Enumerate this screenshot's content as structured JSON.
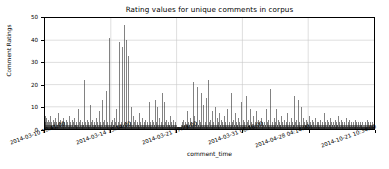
{
  "chart_data": {
    "type": "line",
    "render": "impulse",
    "title": "Rating values for unique comments in corpus",
    "xlabel": "comment_time",
    "ylabel": "Comment Ratings",
    "grid": true,
    "legend": "none",
    "series_color": "#1a1a1a",
    "background": "#ffffff",
    "grid_color": "#c8c8c8",
    "ylim": [
      0,
      50
    ],
    "yticks": [
      0,
      10,
      20,
      30,
      40,
      50
    ],
    "ytick_labels": [
      "0",
      "10",
      "20",
      "30",
      "40",
      "50"
    ],
    "xtick_labels": [
      "2014-03-10 18:41:00",
      "2014-03-14 15:14:00",
      "2014-03-21 17:29:00",
      "2014-03-31 06:16:00",
      "2014-04-28 04:14:00",
      "2014-10-21 10:34:00"
    ],
    "xtick_positions": [
      0.0,
      0.2,
      0.4,
      0.6,
      0.8,
      1.0
    ],
    "x": "index of unique comments ordered by comment_time",
    "values": [
      6,
      2,
      3,
      1,
      5,
      2,
      1,
      3,
      2,
      1,
      2,
      4,
      1,
      2,
      1,
      3,
      1,
      2,
      6,
      1,
      2,
      1,
      3,
      1,
      2,
      1,
      4,
      2,
      1,
      3,
      1,
      2,
      1,
      5,
      1,
      2,
      1,
      3,
      2,
      1,
      2,
      1,
      7,
      2,
      1,
      3,
      1,
      2,
      1,
      4,
      2,
      1,
      2,
      1,
      3,
      1,
      2,
      1,
      2,
      5,
      1,
      2,
      1,
      3,
      1,
      2,
      1,
      4,
      1,
      2,
      1,
      3,
      2,
      1,
      2,
      1,
      6,
      1,
      2,
      1,
      3,
      1,
      2,
      1,
      2,
      1,
      4,
      1,
      2,
      1,
      3,
      1,
      2,
      1,
      5,
      2,
      1,
      2,
      1,
      3,
      1,
      2,
      1,
      2,
      1,
      9,
      1,
      2,
      1,
      3,
      1,
      2,
      1,
      4,
      1,
      2,
      1,
      2,
      1,
      3,
      1,
      2,
      1,
      2,
      1,
      22,
      1,
      2,
      1,
      3,
      1,
      2,
      1,
      4,
      1,
      2,
      1,
      3,
      1,
      2,
      1,
      2,
      1,
      11,
      1,
      2,
      1,
      3,
      1,
      2,
      1,
      4,
      1,
      2,
      1,
      2,
      1,
      3,
      1,
      2,
      1,
      2,
      1,
      5,
      1,
      2,
      1,
      3,
      1,
      2,
      1,
      8,
      1,
      2,
      1,
      3,
      1,
      2,
      1,
      2,
      1,
      13,
      1,
      2,
      1,
      3,
      1,
      2,
      1,
      4,
      1,
      2,
      1,
      2,
      1,
      17,
      1,
      2,
      1,
      3,
      1,
      2,
      1,
      2,
      1,
      41,
      1,
      2,
      1,
      3,
      1,
      2,
      1,
      4,
      1,
      2,
      1,
      2,
      1,
      5,
      1,
      2,
      1,
      3,
      1,
      2,
      1,
      9,
      1,
      2,
      1,
      3,
      1,
      2,
      1,
      2,
      1,
      39,
      1,
      2,
      1,
      3,
      1,
      2,
      1,
      37,
      1,
      2,
      1,
      2,
      1,
      47,
      1,
      2,
      1,
      3,
      1,
      2,
      1,
      40,
      1,
      2,
      1,
      2,
      1,
      33,
      1,
      2,
      1,
      3,
      1,
      2,
      1,
      10,
      1,
      2,
      1,
      2,
      1,
      6,
      1,
      2,
      1,
      3,
      1,
      2,
      1,
      4,
      1,
      2,
      1,
      2,
      1,
      3,
      1,
      2,
      1,
      2,
      1,
      7,
      1,
      2,
      1,
      3,
      1,
      2,
      1,
      2,
      1,
      5,
      1,
      2,
      1,
      3,
      1,
      2,
      1,
      2,
      1,
      4,
      1,
      2,
      1,
      3,
      1,
      2,
      1,
      2,
      1,
      12,
      1,
      2,
      1,
      3,
      1,
      2,
      1,
      2,
      1,
      4,
      1,
      2,
      1,
      3,
      1,
      2,
      1,
      2,
      1,
      13,
      1,
      2,
      1,
      3,
      1,
      2,
      1,
      10,
      1,
      2,
      1,
      2,
      1,
      5,
      1,
      2,
      1,
      3,
      1,
      2,
      1,
      16,
      1,
      2,
      1,
      2,
      1,
      12,
      1,
      2,
      1,
      3,
      1,
      2,
      1,
      4,
      1,
      2,
      1,
      2,
      1,
      3,
      1,
      2,
      1,
      2,
      1,
      6,
      1,
      2,
      1,
      3,
      1,
      2,
      1,
      2,
      1,
      4,
      1,
      2,
      1,
      3,
      1,
      2,
      1,
      2,
      1,
      1,
      1,
      1,
      1,
      1,
      1,
      1,
      1,
      1,
      1,
      1,
      1,
      1,
      1,
      1,
      2,
      1,
      3,
      1,
      2,
      1,
      4,
      1,
      2,
      1,
      2,
      1,
      3,
      1,
      2,
      1,
      2,
      1,
      8,
      1,
      2,
      1,
      3,
      1,
      2,
      1,
      2,
      1,
      5,
      1,
      2,
      1,
      3,
      1,
      2,
      1,
      21,
      1,
      2,
      1,
      2,
      1,
      6,
      1,
      2,
      1,
      3,
      1,
      2,
      1,
      19,
      1,
      2,
      1,
      2,
      1,
      4,
      1,
      2,
      1,
      3,
      1,
      2,
      1,
      16,
      1,
      2,
      1,
      2,
      1,
      11,
      1,
      2,
      1,
      3,
      1,
      2,
      1,
      14,
      1,
      2,
      1,
      2,
      1,
      22,
      1,
      2,
      1,
      3,
      1,
      2,
      1,
      4,
      1,
      2,
      1,
      2,
      1,
      8,
      1,
      2,
      1,
      3,
      1,
      2,
      1,
      10,
      1,
      2,
      1,
      2,
      1,
      5,
      1,
      2,
      1,
      3,
      1,
      2,
      1,
      7,
      1,
      2,
      1,
      2,
      1,
      4,
      1,
      2,
      1,
      3,
      1,
      2,
      1,
      2,
      1,
      6,
      1,
      2,
      1,
      3,
      1,
      2,
      1,
      9,
      1,
      2,
      1,
      2,
      1,
      3,
      1,
      2,
      1,
      2,
      1,
      16,
      1,
      2,
      1,
      3,
      1,
      2,
      1,
      4,
      1,
      2,
      1,
      2,
      1,
      7,
      1,
      2,
      1,
      3,
      1,
      2,
      1,
      2,
      1,
      5,
      1,
      2,
      1,
      3,
      1,
      2,
      1,
      12,
      1,
      2,
      1,
      2,
      1,
      4,
      1,
      2,
      1,
      3,
      1,
      2,
      1,
      2,
      1,
      15,
      1,
      2,
      1,
      3,
      1,
      2,
      1,
      4,
      1,
      2,
      1,
      2,
      1,
      9,
      1,
      2,
      1,
      3,
      1,
      2,
      1,
      2,
      1,
      6,
      1,
      2,
      1,
      3,
      1,
      2,
      1,
      8,
      1,
      2,
      1,
      2,
      1,
      4,
      1,
      2,
      1,
      3,
      1,
      2,
      1,
      2,
      1,
      5,
      1,
      2,
      1,
      3,
      1,
      2,
      1,
      2,
      1,
      3,
      1,
      2,
      1,
      2,
      1,
      9,
      1,
      2,
      1,
      3,
      1,
      2,
      1,
      4,
      1,
      2,
      1,
      2,
      1,
      18,
      1,
      2,
      1,
      3,
      1,
      2,
      1,
      2,
      1,
      5,
      1,
      2,
      1,
      3,
      1,
      2,
      1,
      9,
      1,
      2,
      1,
      2,
      1,
      4,
      1,
      2,
      1,
      3,
      1,
      2,
      1,
      2,
      1,
      6,
      1,
      2,
      1,
      3,
      1,
      2,
      1,
      2,
      1,
      4,
      1,
      2,
      1,
      3,
      1,
      2,
      1,
      7,
      1,
      2,
      1,
      2,
      1,
      3,
      1,
      2,
      1,
      2,
      1,
      5,
      1,
      2,
      1,
      3,
      1,
      2,
      1,
      2,
      1,
      15,
      1,
      2,
      1,
      3,
      1,
      2,
      1,
      4,
      1,
      2,
      1,
      2,
      1,
      13,
      1,
      2,
      1,
      3,
      1,
      2,
      1,
      10,
      1,
      2,
      1,
      2,
      1,
      5,
      1,
      2,
      1,
      3,
      1,
      2,
      1,
      2,
      1,
      4,
      1,
      2,
      1,
      3,
      1,
      2,
      1,
      2,
      1,
      6,
      1,
      2,
      1,
      3,
      1,
      2,
      1,
      2,
      1,
      4,
      1,
      2,
      1,
      3,
      1,
      2,
      1,
      2,
      1,
      5,
      1,
      2,
      1,
      3,
      1,
      2,
      1,
      2,
      1,
      3,
      1,
      2,
      1,
      2,
      1,
      4,
      1,
      2,
      1,
      3,
      1,
      2,
      1,
      2,
      1,
      7,
      1,
      2,
      1,
      3,
      1,
      2,
      1,
      2,
      1,
      4,
      1,
      2,
      1,
      3,
      1,
      2,
      1,
      2,
      1,
      5,
      1,
      2,
      1,
      3,
      1,
      2,
      1,
      2,
      1,
      3,
      1,
      2,
      1,
      2,
      1,
      4,
      1,
      2,
      1,
      3,
      1,
      2,
      1,
      2,
      1,
      6,
      1,
      2,
      1,
      3,
      1,
      2,
      1,
      2,
      1,
      4,
      1,
      2,
      1,
      3,
      1,
      2,
      1,
      2,
      1,
      3,
      1,
      2,
      1,
      2,
      1,
      5,
      1,
      2,
      1,
      3,
      1,
      2,
      1,
      2,
      1,
      4,
      1,
      2,
      1,
      3,
      1,
      2,
      1,
      2,
      1,
      3,
      1,
      2,
      1,
      2,
      1,
      4,
      1,
      2,
      1,
      3,
      1,
      2,
      1,
      2,
      1,
      3,
      1,
      2,
      1,
      2,
      1,
      2,
      1,
      3,
      1,
      2,
      1,
      2,
      1,
      3,
      1,
      2,
      1,
      1,
      1,
      2,
      1,
      3,
      1,
      2,
      1,
      2,
      1,
      4,
      1,
      2,
      1,
      3,
      1,
      2,
      1,
      2,
      1,
      3,
      1,
      2,
      1,
      2,
      1,
      2,
      1,
      3,
      1,
      2,
      1,
      2
    ]
  }
}
